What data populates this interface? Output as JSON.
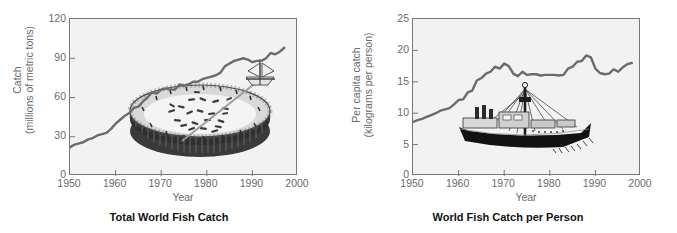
{
  "page": {
    "background_color": "#ffffff",
    "plot_background_color": "#f2f2f2",
    "line_color": "#6b6b6b",
    "axis_color": "#777777",
    "tick_text_color": "#6a6a6a",
    "title_color": "#111111"
  },
  "charts": [
    {
      "id": "total-world-fish-catch",
      "title": "Total World Fish Catch",
      "xlabel": "Year",
      "ylabel_line1": "Catch",
      "ylabel_line2": "(millions of metric tons)",
      "xticks": [
        "1950",
        "1960",
        "1970",
        "1980",
        "1990",
        "2000"
      ],
      "yticks": [
        "0",
        "30",
        "60",
        "90",
        "120"
      ],
      "illustration": "bowl-of-fish-with-boat"
    },
    {
      "id": "world-fish-catch-per-person",
      "title": "World Fish Catch per Person",
      "xlabel": "Year",
      "ylabel_line1": "Per capita catch",
      "ylabel_line2": "(kilograms per person)",
      "xticks": [
        "1950",
        "1960",
        "1970",
        "1980",
        "1990",
        "2000"
      ],
      "yticks": [
        "0",
        "5",
        "10",
        "15",
        "20",
        "25"
      ],
      "illustration": "fishing-trawler-boat"
    }
  ],
  "chart_data": [
    {
      "type": "line",
      "title": "Total World Fish Catch",
      "xlabel": "Year",
      "ylabel": "Catch (millions of metric tons)",
      "xlim": [
        1950,
        2000
      ],
      "ylim": [
        0,
        120
      ],
      "xticks": [
        1950,
        1960,
        1970,
        1980,
        1990,
        2000
      ],
      "yticks": [
        0,
        30,
        60,
        90,
        120
      ],
      "grid": false,
      "legend": "none",
      "x": [
        1950,
        1951,
        1952,
        1953,
        1954,
        1955,
        1956,
        1957,
        1958,
        1959,
        1960,
        1961,
        1962,
        1963,
        1964,
        1965,
        1966,
        1967,
        1968,
        1969,
        1970,
        1971,
        1972,
        1973,
        1974,
        1975,
        1976,
        1977,
        1978,
        1979,
        1980,
        1981,
        1982,
        1983,
        1984,
        1985,
        1986,
        1987,
        1988,
        1989,
        1990,
        1991,
        1992,
        1993,
        1994,
        1995,
        1996,
        1997
      ],
      "y": [
        22,
        24,
        25,
        26,
        28,
        29,
        31,
        32,
        33,
        36,
        40,
        43,
        46,
        48,
        52,
        53,
        57,
        60,
        64,
        63,
        66,
        67,
        66,
        66,
        70,
        69,
        70,
        72,
        72,
        74,
        75,
        76,
        77,
        79,
        84,
        86,
        88,
        89,
        90,
        89,
        87,
        88,
        88,
        90,
        94,
        93,
        95,
        98
      ]
    },
    {
      "type": "line",
      "title": "World Fish Catch per Person",
      "xlabel": "Year",
      "ylabel": "Per capita catch (kilograms per person)",
      "xlim": [
        1950,
        2000
      ],
      "ylim": [
        0,
        25
      ],
      "xticks": [
        1950,
        1960,
        1970,
        1980,
        1990,
        2000
      ],
      "yticks": [
        0,
        5,
        10,
        15,
        20,
        25
      ],
      "grid": false,
      "legend": "none",
      "x": [
        1950,
        1951,
        1952,
        1953,
        1954,
        1955,
        1956,
        1957,
        1958,
        1959,
        1960,
        1961,
        1962,
        1963,
        1964,
        1965,
        1966,
        1967,
        1968,
        1969,
        1970,
        1971,
        1972,
        1973,
        1974,
        1975,
        1976,
        1977,
        1978,
        1979,
        1980,
        1981,
        1982,
        1983,
        1984,
        1985,
        1986,
        1987,
        1988,
        1989,
        1990,
        1991,
        1992,
        1993,
        1994,
        1995,
        1996,
        1997,
        1998
      ],
      "y": [
        8.6,
        8.9,
        9.1,
        9.4,
        9.7,
        10.0,
        10.4,
        10.6,
        10.8,
        11.4,
        12.1,
        12.2,
        13.3,
        13.6,
        15.2,
        15.6,
        16.3,
        16.6,
        17.4,
        17.1,
        17.9,
        17.5,
        16.3,
        15.9,
        16.6,
        16.1,
        16.2,
        16.2,
        16.0,
        16.1,
        16.1,
        16.1,
        16.0,
        16.1,
        17.1,
        17.4,
        18.2,
        18.3,
        19.2,
        18.9,
        17.1,
        16.4,
        16.2,
        16.3,
        17.0,
        16.6,
        17.3,
        17.8,
        18.0
      ]
    }
  ]
}
